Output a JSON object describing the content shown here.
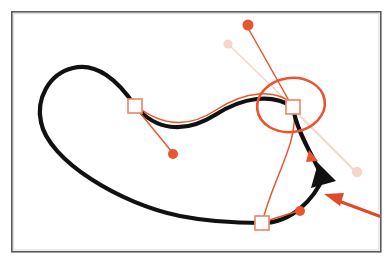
{
  "figure": {
    "canvas": {
      "width": 392,
      "height": 267,
      "background": "#ffffff"
    }
  },
  "colors": {
    "frame_stroke": "#5a5a5a",
    "frame_fill": "#ffffff",
    "path_black": "#111111",
    "accent_orange": "#e8552e",
    "accent_orange_light": "#f07a58",
    "handle_square_stroke": "#f08a6e",
    "handle_square_fill": "#ffffff",
    "faded_pink": "#f7d5c8",
    "pointer_arrow": "#e04a2a"
  },
  "frame": {
    "name": "image-border",
    "x": 11,
    "y": 11,
    "width": 370,
    "height": 241,
    "stroke_width": 1.6
  },
  "shapes": {
    "main_path": {
      "label": "black-bezier-path",
      "stroke_width": 4.2,
      "d": "M 135 106 C 112 74 88 62 68 70 C 44 80 36 104 43 124 C 54 158 140 210 200 219 C 226 223 248 223 262 223 C 262 223 230 218 262 223 C 290 225 312 200 322 176 C 322 176 314 160 302 142 C 296 133 292 120 293 107 C 293 107 282 102 272 100 C 250 96 226 102 198 118 C 172 133 152 124 135 106 Z"
    },
    "main_path_outline": {
      "label": "black-path-visible-segments",
      "segments": [
        {
          "name": "upper-left-loop",
          "d": "M 135 106 C 118 80 96 62 73 68 C 48 74 36 100 41 122"
        },
        {
          "name": "lower-sweep",
          "d": "M 41 122 C 48 160 120 204 180 216 C 215 223 245 223 262 223"
        },
        {
          "name": "right-rise",
          "d": "M 262 223 C 292 223 314 199 324 176"
        },
        {
          "name": "right-upper-return",
          "d": "M 318 168 C 308 148 296 128 293 107"
        },
        {
          "name": "s-curve-back-to-left-handle",
          "d": "M 293 107 C 272 92 242 96 214 114 C 182 134 154 128 135 106"
        }
      ]
    },
    "thin_orange_path": {
      "label": "orange-preview-curve",
      "stroke_width": 1.5,
      "segments": [
        {
          "name": "orange-s-curve",
          "d": "M 135 104 C 158 123 184 130 216 110 C 244 92 274 88 294 104"
        },
        {
          "name": "orange-descending-curve",
          "d": "M 294 107 C 296 130 288 152 278 178 C 270 198 264 214 262 223"
        },
        {
          "name": "orange-inner-curve",
          "d": "M 293 108 C 300 128 308 144 313 156"
        }
      ]
    },
    "selection_ellipse": {
      "label": "selection-ellipse",
      "cx": 291,
      "cy": 105,
      "rx": 34,
      "ry": 27,
      "stroke_width": 2.6,
      "rotation": -8
    },
    "arrowheads": [
      {
        "name": "black-direction-arrowhead",
        "points": "318,163 336,181 311,188",
        "fill": "#111111"
      },
      {
        "name": "orange-small-arrowhead",
        "points": "309,150 318,161 306,162",
        "fill": "#e8552e"
      }
    ],
    "pointer_arrow": {
      "name": "red-pointer-arrow",
      "shaft_d": "M 379 215 L 332 198",
      "head_points": "324,194 344,193 340,206",
      "stroke_width": 3.2
    }
  },
  "handles": [
    {
      "name": "anchor-handle-left",
      "square": {
        "x": 128,
        "y": 99,
        "size": 14
      },
      "control_line": {
        "x1": 136,
        "y1": 108,
        "x2": 172,
        "y2": 152
      },
      "control_dot": {
        "cx": 173,
        "cy": 154,
        "r": 5
      }
    },
    {
      "name": "anchor-handle-right-selected",
      "square": {
        "x": 286,
        "y": 100,
        "size": 14
      },
      "control_lines": [
        {
          "label": "to-upper-dot",
          "x1": 292,
          "y1": 106,
          "x2": 248,
          "y2": 27
        },
        {
          "label": "to-faded-upper-dot",
          "x1": 290,
          "y1": 104,
          "x2": 229,
          "y2": 45
        },
        {
          "label": "to-faded-lower-dot",
          "x1": 294,
          "y1": 110,
          "x2": 355,
          "y2": 171
        }
      ],
      "control_dots": [
        {
          "label": "upper-solid-dot",
          "cx": 248,
          "cy": 25,
          "r": 5.5,
          "color": "#e8552e"
        },
        {
          "label": "upper-faded-dot",
          "cx": 228,
          "cy": 44,
          "r": 4.5,
          "color": "#f7d5c8"
        },
        {
          "label": "lower-faded-dot",
          "cx": 357,
          "cy": 172,
          "r": 5,
          "color": "#f7d5c8"
        }
      ]
    },
    {
      "name": "anchor-handle-bottom",
      "square": {
        "x": 255,
        "y": 216,
        "size": 14
      },
      "control_line": {
        "x1": 263,
        "y1": 222,
        "x2": 298,
        "y2": 211
      },
      "control_dot": {
        "cx": 300,
        "cy": 211,
        "r": 5
      }
    }
  ],
  "legend": {
    "items": []
  }
}
